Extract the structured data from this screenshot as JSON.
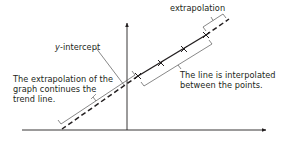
{
  "diagram": {
    "labels": {
      "extrapolation": "extrapolation",
      "y_intercept_var": "y",
      "y_intercept_rest": "-intercept",
      "interpolation_line1": "The line is interpolated",
      "interpolation_line2": "between the points.",
      "extrapolation_note_line1": "The extrapolation of the",
      "extrapolation_note_line2": "graph continues the",
      "extrapolation_note_line3": "trend line."
    },
    "colors": {
      "ink": "#231f20",
      "leader": "#555555",
      "background": "#ffffff"
    },
    "data_points": [
      {
        "x": 138,
        "y": 76
      },
      {
        "x": 161,
        "y": 63
      },
      {
        "x": 184,
        "y": 49
      },
      {
        "x": 206,
        "y": 35
      }
    ]
  }
}
